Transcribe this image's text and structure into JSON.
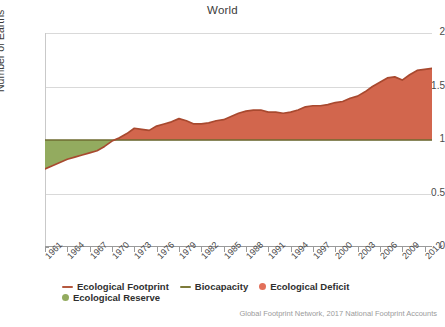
{
  "chart_data": {
    "type": "area",
    "title": "World",
    "xlabel": "",
    "ylabel": "Number of Earths",
    "ylim": [
      0,
      2
    ],
    "xlim": [
      1961,
      2013
    ],
    "grid": true,
    "legend_position": "bottom",
    "ytick_labels": [
      "0",
      "0.5",
      "1",
      "1.5",
      "2"
    ],
    "ytick_values": [
      0,
      0.5,
      1,
      1.5,
      2
    ],
    "xtick_labels": [
      "1961",
      "1964",
      "1967",
      "1970",
      "1973",
      "1976",
      "1979",
      "1982",
      "1985",
      "1988",
      "1991",
      "1994",
      "1997",
      "2000",
      "2003",
      "2006",
      "2009",
      "2012"
    ],
    "xtick_values": [
      1961,
      1964,
      1967,
      1970,
      1973,
      1976,
      1979,
      1982,
      1985,
      1988,
      1991,
      1994,
      1997,
      2000,
      2003,
      2006,
      2009,
      2012
    ],
    "baseline_label": "Biocapacity",
    "baseline_value": 1.0,
    "series": [
      {
        "name": "Ecological Footprint",
        "x": [
          1961,
          1962,
          1963,
          1964,
          1965,
          1966,
          1967,
          1968,
          1969,
          1970,
          1971,
          1972,
          1973,
          1974,
          1975,
          1976,
          1977,
          1978,
          1979,
          1980,
          1981,
          1982,
          1983,
          1984,
          1985,
          1986,
          1987,
          1988,
          1989,
          1990,
          1991,
          1992,
          1993,
          1994,
          1995,
          1996,
          1997,
          1998,
          1999,
          2000,
          2001,
          2002,
          2003,
          2004,
          2005,
          2006,
          2007,
          2008,
          2009,
          2010,
          2011,
          2012,
          2013
        ],
        "values": [
          0.73,
          0.76,
          0.79,
          0.82,
          0.84,
          0.86,
          0.88,
          0.9,
          0.94,
          0.99,
          1.02,
          1.06,
          1.11,
          1.1,
          1.09,
          1.13,
          1.15,
          1.17,
          1.2,
          1.18,
          1.15,
          1.15,
          1.16,
          1.18,
          1.19,
          1.22,
          1.25,
          1.27,
          1.28,
          1.28,
          1.26,
          1.26,
          1.25,
          1.26,
          1.28,
          1.31,
          1.32,
          1.32,
          1.33,
          1.35,
          1.36,
          1.39,
          1.41,
          1.45,
          1.5,
          1.54,
          1.58,
          1.59,
          1.56,
          1.61,
          1.65,
          1.66,
          1.67
        ]
      },
      {
        "name": "Biocapacity",
        "x": [
          1961,
          2013
        ],
        "values": [
          1.0,
          1.0
        ]
      }
    ],
    "legend": [
      {
        "label": "Ecological Footprint",
        "marker": "line",
        "color": "#b5583f"
      },
      {
        "label": "Biocapacity",
        "marker": "line",
        "color": "#7d7b3a"
      },
      {
        "label": "Ecological Deficit",
        "marker": "dot",
        "color": "#e2705a"
      },
      {
        "label": "Ecological Reserve",
        "marker": "dot",
        "color": "#93ab5f"
      }
    ],
    "annotations": {
      "source": "Global Footprint Network, 2017 National Footprint Accounts"
    },
    "colors": {
      "deficit_fill": "#d2664d",
      "reserve_fill": "#93ab5f",
      "footprint_line": "#a8492f",
      "biocapacity_line": "#6e6b30",
      "grid": "#d9d9d9",
      "axis": "#9a9a9a",
      "text": "#3b3b3b",
      "source_text": "#9b9b9b"
    }
  }
}
